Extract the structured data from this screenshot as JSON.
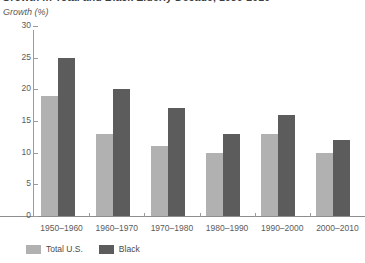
{
  "title": "Growth in Total and Black Elderly Decade, 1950-2010",
  "subtitle": "Growth (%)",
  "legend": {
    "position": "bottom-left",
    "items": [
      {
        "label": "Total U.S.",
        "color": "#b1b1b1",
        "swatch_name": "legend-swatch-total-us"
      },
      {
        "label": "Black",
        "color": "#5c5c5c",
        "swatch_name": "legend-swatch-black"
      }
    ]
  },
  "axis": {
    "y_ticks": [
      "0",
      "5",
      "10",
      "15",
      "20",
      "25",
      "30"
    ],
    "x_ticks": [
      "1950–1960",
      "1960–1970",
      "1970–1980",
      "1980–1990",
      "1990–2000",
      "2000–2010"
    ]
  },
  "chart_data": {
    "type": "bar",
    "title": "Growth in Total and Black Elderly Decade, 1950-2010",
    "xlabel": "",
    "ylabel": "Growth (%)",
    "ylim": [
      0,
      30
    ],
    "ytick_step": 5,
    "grid": false,
    "legend_position": "bottom-left",
    "categories": [
      "1950–1960",
      "1960–1970",
      "1970–1980",
      "1980–1990",
      "1990–2000",
      "2000–2010"
    ],
    "series": [
      {
        "name": "Total U.S.",
        "color": "#b1b1b1",
        "values": [
          19,
          13,
          11,
          10,
          13,
          10
        ]
      },
      {
        "name": "Black",
        "color": "#5c5c5c",
        "values": [
          25,
          20,
          17,
          13,
          16,
          12
        ]
      }
    ]
  }
}
